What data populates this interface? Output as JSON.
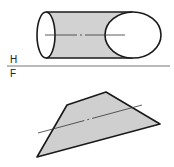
{
  "diagram": {
    "type": "orthographic-projection",
    "upper_view": "cylinder (H plane)",
    "lower_view": "trapezoid section (F plane)",
    "labels": {
      "top_plane": "H",
      "bottom_plane": "F"
    },
    "colors": {
      "stroke": "#1a1a1a",
      "fill": "#cfcfcf",
      "background": "#ffffff"
    }
  }
}
